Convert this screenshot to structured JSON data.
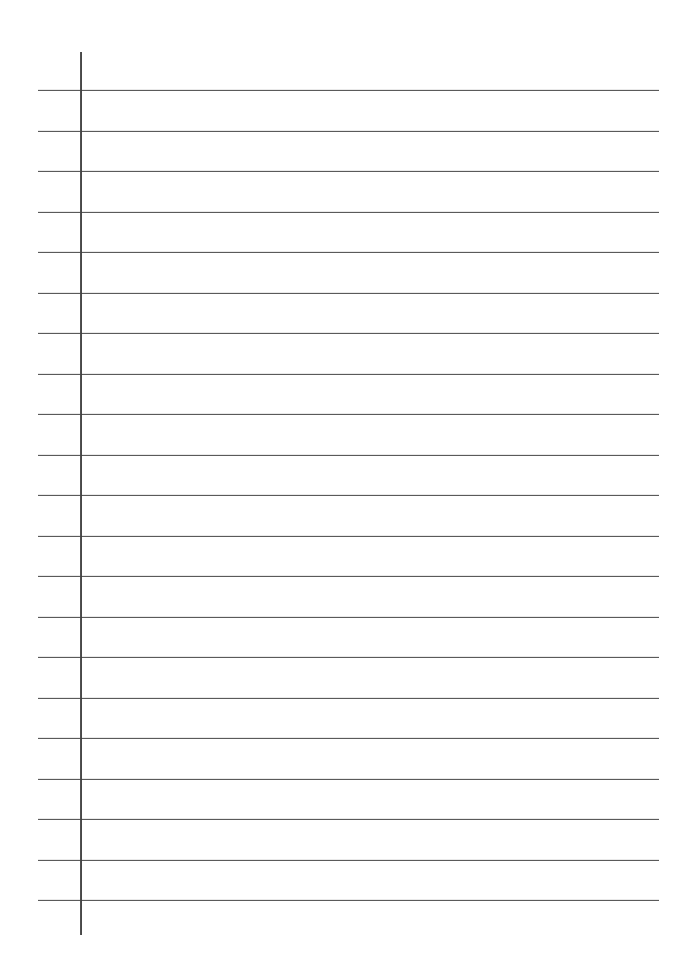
{
  "document": {
    "kind": "lined-paper",
    "title": "Blank Ruled Notebook Page",
    "background_color": "#ffffff",
    "width_px": 689,
    "height_px": 973,
    "text_content": "",
    "has_written_content": false
  },
  "ruling": {
    "line_color": "#4d4d4d",
    "line_thickness_px": 1.5,
    "line_count": 21,
    "first_line_y": 90,
    "line_spacing_px": 40.5,
    "line_start_x": 38,
    "line_end_x": 659,
    "lines_y": [
      90,
      130.5,
      171,
      211.5,
      252,
      292.5,
      333,
      373.5,
      414,
      454.5,
      495,
      535.5,
      576,
      616.5,
      657,
      697.5,
      738,
      778.5,
      819,
      859.5,
      900
    ]
  },
  "margin_rule": {
    "name": "vertical-margin-line",
    "color": "#3f3f3f",
    "thickness_px": 2,
    "x": 80,
    "top_y": 52,
    "bottom_y": 935
  }
}
